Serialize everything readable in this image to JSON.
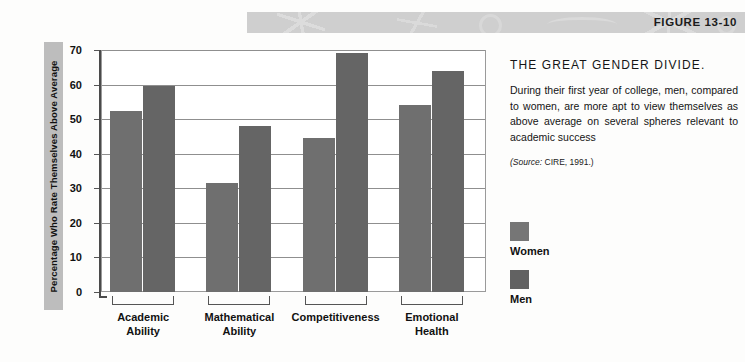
{
  "figure": {
    "label": "FIGURE 13-10"
  },
  "sidebar": {
    "title": "THE GREAT GENDER DIVIDE.",
    "body": "During their first year of college, men, compared to women, are more apt to view themselves as above average on several spheres relevant to academic success",
    "source_prefix": "(Source:",
    "source_text": " CIRE, 1991.)"
  },
  "legend": {
    "items": [
      {
        "label": "Women",
        "color": "#767676"
      },
      {
        "label": "Men",
        "color": "#626262"
      }
    ]
  },
  "chart_data": {
    "type": "bar",
    "title": "THE GREAT GENDER DIVIDE.",
    "xlabel": "",
    "ylabel": "Percentage Who Rate Themselves Above Average",
    "ylim": [
      0,
      70
    ],
    "yticks": [
      0,
      10,
      20,
      30,
      40,
      50,
      60,
      70
    ],
    "ytick_labels": [
      "0",
      "10",
      "20",
      "30",
      "40",
      "50",
      "60",
      "70"
    ],
    "grid": true,
    "legend_position": "right",
    "categories": [
      "Academic Ability",
      "Mathematical Ability",
      "Competitiveness",
      "Emotional Health"
    ],
    "category_lines": [
      [
        "Academic",
        "Ability"
      ],
      [
        "Mathematical",
        "Ability"
      ],
      [
        "Competitiveness",
        ""
      ],
      [
        "Emotional",
        "Health"
      ]
    ],
    "series": [
      {
        "name": "Women",
        "color": "#6f6f6f",
        "values": [
          52.5,
          31.5,
          44.5,
          54
        ]
      },
      {
        "name": "Men",
        "color": "#656565",
        "values": [
          59.5,
          48,
          69,
          64
        ]
      }
    ]
  }
}
